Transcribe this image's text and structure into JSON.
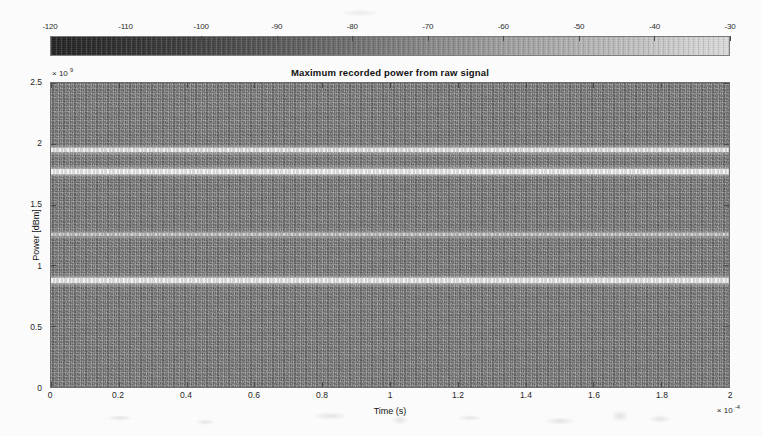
{
  "figure": {
    "title": "Maximum recorded power from raw signal"
  },
  "colorbar": {
    "name": "power-colorbar",
    "orientation": "horizontal",
    "min": -120,
    "max": -30,
    "unit": "dBm",
    "colormap": "gray",
    "low_color": "#232323",
    "high_color": "#dcdcdc",
    "ticks": [
      {
        "value": -120,
        "label": "-120"
      },
      {
        "value": -110,
        "label": "-110"
      },
      {
        "value": -100,
        "label": "-100"
      },
      {
        "value": -90,
        "label": "-90"
      },
      {
        "value": -80,
        "label": "-80"
      },
      {
        "value": -70,
        "label": "-70"
      },
      {
        "value": -60,
        "label": "-60"
      },
      {
        "value": -50,
        "label": "-50"
      },
      {
        "value": -40,
        "label": "-40"
      },
      {
        "value": -30,
        "label": "-30"
      }
    ]
  },
  "axes": {
    "x": {
      "title": "Time (s)",
      "exponent_label": "× 10",
      "exponent_power": "-4",
      "min": 0,
      "max": 2,
      "ticks": [
        {
          "value": 0,
          "label": "0"
        },
        {
          "value": 0.2,
          "label": "0.2"
        },
        {
          "value": 0.4,
          "label": "0.4"
        },
        {
          "value": 0.6,
          "label": "0.6"
        },
        {
          "value": 0.8,
          "label": "0.8"
        },
        {
          "value": 1.0,
          "label": "1"
        },
        {
          "value": 1.2,
          "label": "1.2"
        },
        {
          "value": 1.4,
          "label": "1.4"
        },
        {
          "value": 1.6,
          "label": "1.6"
        },
        {
          "value": 1.8,
          "label": "1.8"
        },
        {
          "value": 2.0,
          "label": "2"
        }
      ]
    },
    "y": {
      "title": "Power [dBm]",
      "exponent_label": "× 10",
      "exponent_power": "9",
      "min": 0,
      "max": 2.5,
      "ticks": [
        {
          "value": 0,
          "label": "0"
        },
        {
          "value": 0.5,
          "label": "0.5"
        },
        {
          "value": 1.0,
          "label": "1"
        },
        {
          "value": 1.5,
          "label": "1.5"
        },
        {
          "value": 2.0,
          "label": "2"
        },
        {
          "value": 2.5,
          "label": "2.5"
        }
      ]
    }
  },
  "chart_data": {
    "type": "heatmap",
    "title": "Maximum recorded power from raw signal",
    "xlabel": "Time (s)",
    "ylabel": "Power [dBm]",
    "xlim": [
      0,
      2
    ],
    "ylim": [
      0,
      2.5
    ],
    "x_exponent": -4,
    "y_exponent": 9,
    "grid": false,
    "legend": "colorbar-horizontal-top",
    "colorbar_range": [
      -120,
      -30
    ],
    "colorbar_unit": "dBm",
    "colormap": "gray",
    "background_level_dbm": -75,
    "features": [
      {
        "name": "carrier-band-1",
        "y_value": 1950000000.0,
        "intensity_dbm": -40,
        "thickness_rel": 0.013,
        "brightness": "bright"
      },
      {
        "name": "carrier-band-2",
        "y_value": 1775000000.0,
        "intensity_dbm": -37,
        "thickness_rel": 0.016,
        "brightness": "brightest"
      },
      {
        "name": "carrier-band-3",
        "y_value": 1255000000.0,
        "intensity_dbm": -58,
        "thickness_rel": 0.009,
        "brightness": "faint"
      },
      {
        "name": "carrier-band-4",
        "y_value": 875000000.0,
        "intensity_dbm": -38,
        "thickness_rel": 0.016,
        "brightness": "brightest"
      }
    ],
    "series": [
      {
        "name": "noise-floor",
        "values_dbm": [
          -78,
          -76,
          -74,
          -77,
          -75,
          -73,
          -76,
          -78,
          -74,
          -75,
          -77
        ]
      },
      {
        "name": "carrier-band-1",
        "values_dbm": [
          -41,
          -40,
          -39,
          -40,
          -41,
          -40,
          -39,
          -40,
          -41,
          -40,
          -39
        ]
      },
      {
        "name": "carrier-band-2",
        "values_dbm": [
          -37,
          -36,
          -37,
          -38,
          -37,
          -36,
          -37,
          -38,
          -37,
          -36,
          -37
        ]
      },
      {
        "name": "carrier-band-3",
        "values_dbm": [
          -59,
          -58,
          -57,
          -59,
          -58,
          -57,
          -58,
          -59,
          -58,
          -57,
          -58
        ]
      },
      {
        "name": "carrier-band-4",
        "values_dbm": [
          -38,
          -37,
          -38,
          -39,
          -38,
          -37,
          -38,
          -39,
          -38,
          -37,
          -38
        ]
      }
    ]
  }
}
